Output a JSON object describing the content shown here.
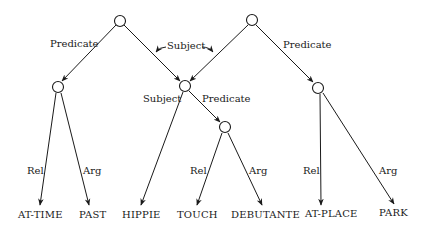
{
  "diagram": {
    "type": "propositional-network",
    "nodes": [
      {
        "id": "n1",
        "kind": "proposition"
      },
      {
        "id": "n2",
        "kind": "proposition"
      },
      {
        "id": "n3",
        "kind": "proposition"
      },
      {
        "id": "n4",
        "kind": "proposition"
      },
      {
        "id": "n5",
        "kind": "proposition"
      },
      {
        "id": "n6",
        "kind": "proposition"
      }
    ],
    "leaves": [
      {
        "id": "at-time",
        "label": "AT-TIME"
      },
      {
        "id": "past",
        "label": "PAST"
      },
      {
        "id": "hippie",
        "label": "HIPPIE"
      },
      {
        "id": "touch",
        "label": "TOUCH"
      },
      {
        "id": "debutante",
        "label": "DEBUTANTE"
      },
      {
        "id": "at-place",
        "label": "AT-PLACE"
      },
      {
        "id": "park",
        "label": "PARK"
      }
    ],
    "edges": [
      {
        "from": "n1",
        "to": "n3",
        "label": "Predicate"
      },
      {
        "from": "n1",
        "to": "n4",
        "label": "Subject"
      },
      {
        "from": "n2",
        "to": "n4",
        "label": "Subject"
      },
      {
        "from": "n2",
        "to": "n6",
        "label": "Predicate"
      },
      {
        "from": "n3",
        "to": "at-time",
        "label": "Rel"
      },
      {
        "from": "n3",
        "to": "past",
        "label": "Arg"
      },
      {
        "from": "n4",
        "to": "hippie",
        "label": "Subject"
      },
      {
        "from": "n4",
        "to": "n5",
        "label": "Predicate"
      },
      {
        "from": "n5",
        "to": "touch",
        "label": "Rel"
      },
      {
        "from": "n5",
        "to": "debutante",
        "label": "Arg"
      },
      {
        "from": "n6",
        "to": "at-place",
        "label": "Rel"
      },
      {
        "from": "n6",
        "to": "park",
        "label": "Arg"
      }
    ],
    "labels": {
      "top_left_predicate": "Predicate",
      "shared_subject": "Subject",
      "top_right_predicate": "Predicate",
      "mid_subject": "Subject",
      "mid_predicate": "Predicate",
      "left_rel": "Rel",
      "left_arg": "Arg",
      "mid_rel": "Rel",
      "mid_arg": "Arg",
      "right_rel": "Rel",
      "right_arg": "Arg"
    }
  }
}
